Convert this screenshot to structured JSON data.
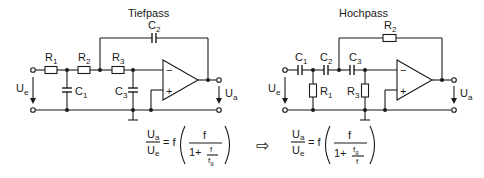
{
  "diagram": {
    "lowpass": {
      "title": "Tiefpass",
      "components": {
        "R1": {
          "name": "R",
          "sub": "1"
        },
        "R2": {
          "name": "R",
          "sub": "2"
        },
        "R3": {
          "name": "R",
          "sub": "3"
        },
        "C1": {
          "name": "C",
          "sub": "1"
        },
        "C2": {
          "name": "C",
          "sub": "2"
        },
        "C3": {
          "name": "C",
          "sub": "3"
        }
      },
      "input_voltage": {
        "name": "U",
        "sub": "e"
      },
      "output_voltage": {
        "name": "U",
        "sub": "a"
      },
      "opamp": {
        "minus": "−",
        "plus": "+"
      },
      "formula": {
        "lhs_num": {
          "name": "U",
          "sub": "a"
        },
        "lhs_den": {
          "name": "U",
          "sub": "e"
        },
        "eq": "= f",
        "inner_num": "f",
        "inner_den_prefix": "1+",
        "frac_num": "f",
        "frac_den": {
          "name": "f",
          "sub": "g"
        }
      }
    },
    "arrow": "⇨",
    "highpass": {
      "title": "Hochpass",
      "components": {
        "C1": {
          "name": "C",
          "sub": "1"
        },
        "C2": {
          "name": "C",
          "sub": "2"
        },
        "C3": {
          "name": "C",
          "sub": "3"
        },
        "R1": {
          "name": "R",
          "sub": "1"
        },
        "R2": {
          "name": "R",
          "sub": "2"
        },
        "R3": {
          "name": "R",
          "sub": "3"
        }
      },
      "input_voltage": {
        "name": "U",
        "sub": "e"
      },
      "output_voltage": {
        "name": "U",
        "sub": "a"
      },
      "opamp": {
        "minus": "−",
        "plus": "+"
      },
      "formula": {
        "lhs_num": {
          "name": "U",
          "sub": "a"
        },
        "lhs_den": {
          "name": "U",
          "sub": "e"
        },
        "eq": "= f",
        "inner_num": "f",
        "inner_den_prefix": "1+",
        "frac_num": {
          "name": "f",
          "sub": "g"
        },
        "frac_den": "f"
      }
    }
  }
}
